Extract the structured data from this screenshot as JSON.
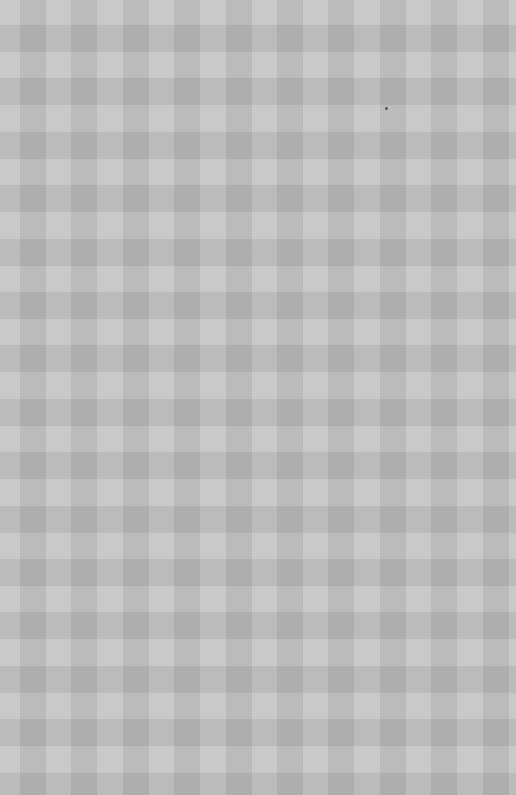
{
  "image": {
    "description": "Gray gingham checkered paper texture",
    "pattern": "gingham",
    "colors": {
      "light": "#c9c9c9",
      "medium": "#b8b8b8",
      "dark": "#a7a7a7"
    },
    "horizontal_period_px": 51.4,
    "vertical_period_px": 53.4,
    "specks": [
      {
        "x": 386,
        "y": 108
      }
    ]
  }
}
